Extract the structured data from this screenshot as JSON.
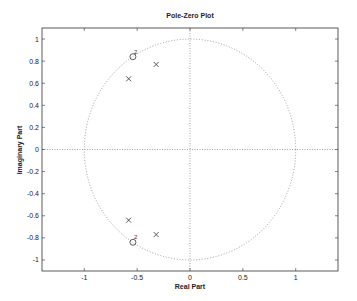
{
  "chart_data": {
    "type": "scatter",
    "title": "Pole-Zero Plot",
    "xlabel": "Real Part",
    "ylabel": "Imaginary Part",
    "xlim": [
      -1.4,
      1.4
    ],
    "ylim": [
      -1.1,
      1.1
    ],
    "xticks": [
      -1,
      -0.5,
      0,
      0.5,
      1
    ],
    "xtick_labels": [
      "-1",
      "-0.5",
      "0",
      "0.5",
      "1"
    ],
    "yticks": [
      1,
      0.8,
      0.6,
      0.4,
      0.2,
      0,
      -0.2,
      -0.4,
      -0.6,
      -0.8,
      -1
    ],
    "ytick_labels": [
      "1",
      "0.8",
      "0.6",
      "0.4",
      "0.2",
      "0",
      "-0.2",
      "-0.4",
      "-0.6",
      "-0.8",
      "-1"
    ],
    "grid": false,
    "unit_circle": true,
    "series": [
      {
        "name": "zeros",
        "marker": "o",
        "points": [
          {
            "x": -0.54,
            "y": 0.84,
            "multiplicity": 2,
            "label": "2"
          },
          {
            "x": -0.54,
            "y": -0.84,
            "multiplicity": 2,
            "label": "2"
          }
        ]
      },
      {
        "name": "poles",
        "marker": "x",
        "points": [
          {
            "x": -0.32,
            "y": 0.77
          },
          {
            "x": -0.58,
            "y": 0.64
          },
          {
            "x": -0.58,
            "y": -0.64
          },
          {
            "x": -0.32,
            "y": -0.77
          }
        ]
      }
    ]
  }
}
